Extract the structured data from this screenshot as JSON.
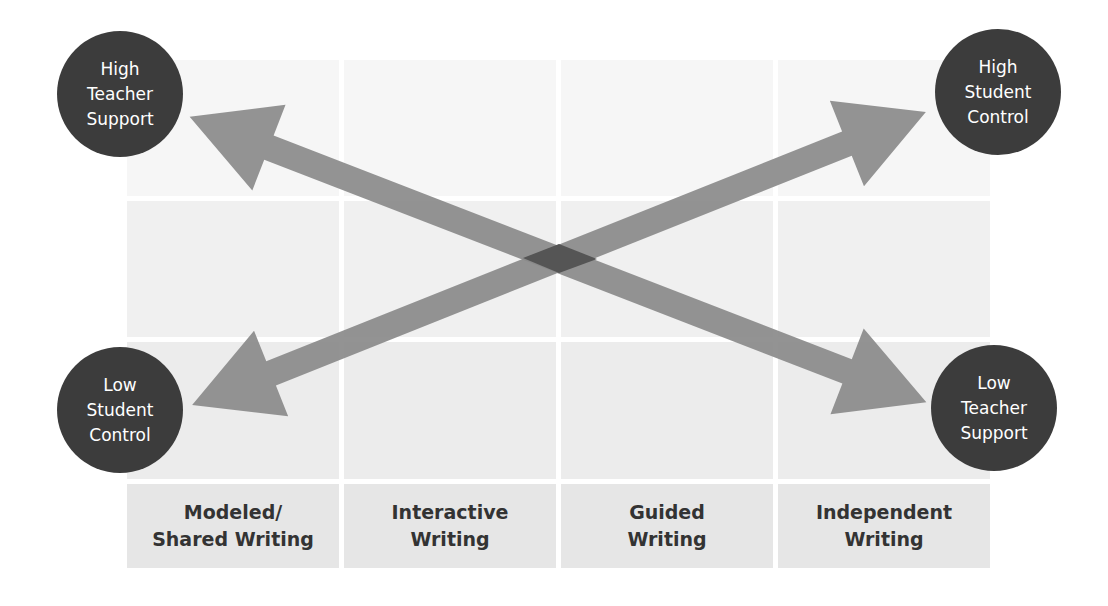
{
  "diagram": {
    "type": "gradual-release-matrix",
    "colors": {
      "circle_fill": "#3c3c3c",
      "arrow_fill": "#8a8a8a",
      "arrow_overlap": "#555555",
      "cell_light": "#f4f4f4",
      "label_cell": "#e6e6e6",
      "label_text": "#333333"
    },
    "corners": {
      "top_left": "High\nTeacher\nSupport",
      "top_right": "High\nStudent\nControl",
      "bottom_left": "Low\nStudent\nControl",
      "bottom_right": "Low\nTeacher\nSupport"
    },
    "arrows": [
      {
        "name": "teacher-support-arrow",
        "from": "High Teacher Support",
        "to": "Low Teacher Support",
        "double_headed": true
      },
      {
        "name": "student-control-arrow",
        "from": "Low Student Control",
        "to": "High Student Control",
        "double_headed": true
      }
    ],
    "columns": [
      {
        "label": "Modeled/\nShared Writing"
      },
      {
        "label": "Interactive\nWriting"
      },
      {
        "label": "Guided\nWriting"
      },
      {
        "label": "Independent\nWriting"
      }
    ],
    "grid_rows": 3
  }
}
